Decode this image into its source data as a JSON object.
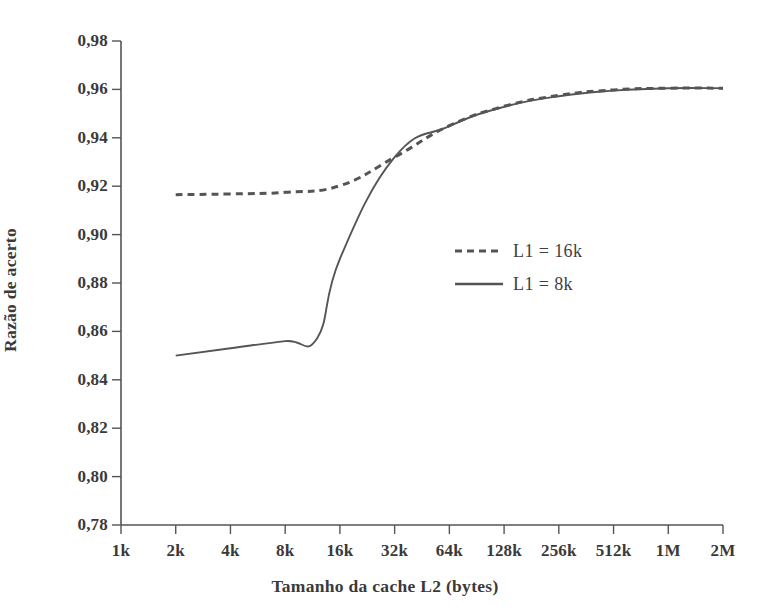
{
  "chart_data": {
    "type": "line",
    "title": "",
    "xlabel": "Tamanho da cache L2 (bytes)",
    "ylabel": "Razão de acerto",
    "categories": [
      "1k",
      "2k",
      "4k",
      "8k",
      "16k",
      "32k",
      "64k",
      "128k",
      "256k",
      "512k",
      "1M",
      "2M"
    ],
    "xticks": [
      "1k",
      "2k",
      "4k",
      "8k",
      "16k",
      "32k",
      "64k",
      "128k",
      "256k",
      "512k",
      "1M",
      "2M"
    ],
    "yticks": [
      "0,78",
      "0,80",
      "0,82",
      "0,84",
      "0,86",
      "0,88",
      "0,90",
      "0,92",
      "0,94",
      "0,96",
      "0,98"
    ],
    "ylim": [
      0.78,
      0.98
    ],
    "ytick_step": 0.02,
    "grid": false,
    "legend_position": "center-right",
    "line_color": "#555555",
    "series": [
      {
        "name": "L1 = 16k",
        "style": "dashed",
        "x": [
          "2k",
          "4k",
          "8k",
          "16k",
          "32k",
          "64k",
          "128k",
          "256k",
          "512k",
          "1M",
          "2M"
        ],
        "values": [
          0.9165,
          0.9168,
          0.9175,
          0.9202,
          0.932,
          0.945,
          0.953,
          0.9575,
          0.9598,
          0.9605,
          0.9605
        ]
      },
      {
        "name": "L1 = 8k",
        "style": "solid",
        "x": [
          "2k",
          "4k",
          "8k",
          "12k",
          "16k",
          "32k",
          "64k",
          "128k",
          "256k",
          "512k",
          "1M",
          "2M"
        ],
        "values": [
          0.85,
          0.853,
          0.856,
          0.8572,
          0.89,
          0.932,
          0.9448,
          0.9528,
          0.9572,
          0.9595,
          0.9605,
          0.9605
        ]
      }
    ]
  },
  "legend": {
    "items": [
      {
        "label": "L1 = 16k",
        "style": "dashed"
      },
      {
        "label": "L1 = 8k",
        "style": "solid"
      }
    ]
  }
}
